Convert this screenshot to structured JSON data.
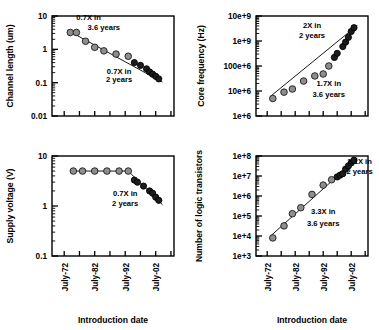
{
  "figure": {
    "marker_light_color": "#8e8e8e",
    "marker_dark_color": "#1c1c1c",
    "axis_color": "#000000",
    "background": "#ffffff"
  },
  "chart_data": [
    {
      "id": "channel-length",
      "type": "scatter",
      "title": "",
      "xlabel": "Introduction date",
      "ylabel": "Channel length (um)",
      "yscale": "log",
      "ylim": [
        0.01,
        10
      ],
      "ytick_labels": [
        "10",
        "1",
        "0.1",
        "0.01"
      ],
      "ytick_values": [
        10,
        1,
        0.1,
        0.01
      ],
      "xtick_labels": [
        "July-72",
        "July-82",
        "July-92",
        "July-02"
      ],
      "xtick_values": [
        1972,
        1982,
        1992,
        2002
      ],
      "xlim": [
        1968,
        2008
      ],
      "grid": false,
      "series": [
        {
          "name": "0.7X in 3.6 years era",
          "marker": "light",
          "x": [
            1974,
            1976,
            1979,
            1982,
            1985,
            1989,
            1993
          ],
          "y": [
            3.2,
            3.2,
            1.75,
            1.15,
            0.9,
            0.72,
            0.62
          ]
        },
        {
          "name": "0.7X in 2 years era",
          "marker": "dark",
          "x": [
            1995,
            1997,
            1999,
            2000,
            2001,
            2002,
            2003
          ],
          "y": [
            0.4,
            0.33,
            0.26,
            0.21,
            0.18,
            0.155,
            0.13
          ]
        }
      ],
      "annotations": [
        {
          "text": "0.7X in",
          "x": 1980,
          "y": 7.4
        },
        {
          "text": "3.6 years",
          "x": 1985,
          "y": 3.7
        },
        {
          "text": "0.7X in",
          "x": 1990,
          "y": 0.18
        },
        {
          "text": "2 years",
          "x": 1990,
          "y": 0.105
        }
      ]
    },
    {
      "id": "core-frequency",
      "type": "scatter",
      "title": "",
      "xlabel": "Introduction date",
      "ylabel": "Core frequency (Hz)",
      "yscale": "log",
      "ylim": [
        1000000,
        10000000000
      ],
      "ytick_labels": [
        "10e+9",
        "1e+9",
        "100e+6",
        "10e+6",
        "1e+6"
      ],
      "ytick_values": [
        10000000000,
        1000000000,
        100000000,
        10000000,
        1000000
      ],
      "xtick_labels": [
        "July-72",
        "July-82",
        "July-92",
        "July-02"
      ],
      "xtick_values": [
        1972,
        1982,
        1992,
        2002
      ],
      "xlim": [
        1968,
        2008
      ],
      "grid": false,
      "series": [
        {
          "name": "1.7X in 3.6 years era",
          "marker": "light",
          "x": [
            1974,
            1978,
            1981,
            1985,
            1989,
            1992,
            1994
          ],
          "y": [
            5000000,
            9000000,
            12000000,
            25000000,
            40000000,
            48000000,
            100000000
          ]
        },
        {
          "name": "2X in 2 years era",
          "marker": "dark",
          "x": [
            1996,
            1997,
            1999,
            2000,
            2001,
            2002,
            2003
          ],
          "y": [
            220000000,
            320000000,
            600000000,
            900000000,
            1400000000,
            2400000000,
            3400000000
          ]
        }
      ],
      "annotations": [
        {
          "text": "2X in",
          "x": 1988,
          "y": 3200000000
        },
        {
          "text": "2 years",
          "x": 1988,
          "y": 1300000000
        },
        {
          "text": "1.7X in",
          "x": 1994,
          "y": 16000000
        },
        {
          "text": "3.6 years",
          "x": 1994,
          "y": 5500000
        }
      ]
    },
    {
      "id": "supply-voltage",
      "type": "scatter",
      "title": "",
      "xlabel": "Introduction date",
      "ylabel": "Supply voltage (V)",
      "yscale": "log",
      "ylim": [
        0.1,
        10
      ],
      "ytick_labels": [
        "10",
        "1",
        "0.1"
      ],
      "ytick_values": [
        10,
        1,
        0.1
      ],
      "xtick_labels": [
        "July-72",
        "July-82",
        "July-92",
        "July-02"
      ],
      "xtick_values": [
        1972,
        1982,
        1992,
        2002
      ],
      "xlim": [
        1968,
        2008
      ],
      "grid": false,
      "series": [
        {
          "name": "Constant 5V era",
          "marker": "light",
          "x": [
            1975,
            1978,
            1982,
            1986,
            1990,
            1993
          ],
          "y": [
            5.0,
            5.0,
            5.0,
            5.0,
            5.0,
            5.0
          ]
        },
        {
          "name": "0.7X in 2 years era",
          "marker": "dark",
          "x": [
            1995,
            1996,
            1998,
            2000,
            2001,
            2002,
            2003
          ],
          "y": [
            3.3,
            3.0,
            2.5,
            2.0,
            1.8,
            1.5,
            1.3
          ]
        }
      ],
      "annotations": [
        {
          "text": "0.7X in",
          "x": 1992,
          "y": 1.6
        },
        {
          "text": "2 years",
          "x": 1992,
          "y": 1.0
        }
      ]
    },
    {
      "id": "logic-transistors",
      "type": "scatter",
      "title": "",
      "xlabel": "Introduction date",
      "ylabel": "Number of logic transistors",
      "yscale": "log",
      "ylim": [
        1000,
        100000000
      ],
      "ytick_labels": [
        "1e+8",
        "1e+7",
        "1e+6",
        "1e+5",
        "1e+4",
        "1e+3"
      ],
      "ytick_values": [
        100000000,
        10000000,
        1000000,
        100000,
        10000,
        1000
      ],
      "xtick_labels": [
        "July-72",
        "July-82",
        "July-92",
        "July-02"
      ],
      "xtick_values": [
        1972,
        1982,
        1992,
        2002
      ],
      "xlim": [
        1968,
        2008
      ],
      "grid": false,
      "series": [
        {
          "name": "3.3X in 3.6 years era",
          "marker": "light",
          "x": [
            1974,
            1978,
            1981,
            1984,
            1988,
            1992,
            1995
          ],
          "y": [
            8000,
            32000,
            130000,
            260000,
            1200000,
            3500000,
            6500000
          ]
        },
        {
          "name": "2.1X in 2 years era",
          "marker": "dark",
          "x": [
            1997,
            1998,
            1999,
            2000,
            2001,
            2002,
            2003
          ],
          "y": [
            9000000,
            11000000,
            13000000,
            22000000,
            32000000,
            45000000,
            62000000
          ]
        }
      ],
      "annotations": [
        {
          "text": "3.3X in",
          "x": 1992,
          "y": 120000
        },
        {
          "text": "3.6 years",
          "x": 1992,
          "y": 33000
        },
        {
          "text": "2.1X in",
          "x": 2005,
          "y": 42000000
        },
        {
          "text": "2 years",
          "x": 2005,
          "y": 13000000
        }
      ]
    }
  ]
}
